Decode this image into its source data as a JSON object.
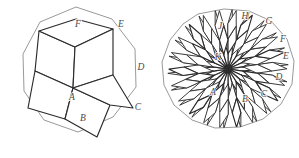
{
  "figure": {
    "caption": "",
    "colors": {
      "outline": "#8d8d8d",
      "rhombus_edge": "#2b2b2b",
      "label": "#4a4a4a",
      "background": "#ffffff"
    }
  },
  "left_figure": {
    "name": "decagon-rhombic-tiling",
    "polygon_sides": 10,
    "rhombus_count": 5,
    "center_vertex": "A-apex",
    "labels": [
      {
        "id": "A",
        "text": "A",
        "x": 73,
        "y": 98
      },
      {
        "id": "B",
        "text": "B",
        "x": 83,
        "y": 119
      },
      {
        "id": "C",
        "text": "C",
        "x": 139,
        "y": 108
      },
      {
        "id": "D",
        "text": "D",
        "x": 141,
        "y": 68
      },
      {
        "id": "E",
        "text": "E",
        "x": 121,
        "y": 27
      },
      {
        "id": "F",
        "text": "F",
        "x": 78,
        "y": 26
      }
    ],
    "polygon_points": "42,22 76,8 112,19 135,48 137,86 116,117 81,132 47,122 25,93 22,55",
    "rhombi": [
      "73,88 40,96 34,59 68,49",
      "68,49 73,88 107,92 104,52",
      "73,88 60,119 87,131 100,100",
      "37,99 73,88 60,119 33,109",
      "104,52 68,49 78,20 115,24"
    ],
    "rhombi_inner": [
      "68,49 104,52 107,92 73,88",
      "33,109 37,99 73,88 60,119",
      "60,119 73,88 100,100 87,131",
      "34,59 40,96 73,88 68,49",
      "78,20 115,24 104,52 68,49"
    ],
    "cube_rhombi": [
      "73,88 68,49 78,20 118,24 115,57 107,92",
      "73,88 40,96 34,59 68,49"
    ]
  },
  "right_figure": {
    "name": "polygon-full-rhombic-tiling",
    "polygon_sides": 22,
    "labels": [
      {
        "id": "A",
        "text": "A",
        "x": 212,
        "y": 92
      },
      {
        "id": "B",
        "text": "B",
        "x": 245,
        "y": 100
      },
      {
        "id": "C",
        "text": "C",
        "x": 264,
        "y": 96
      },
      {
        "id": "D",
        "text": "D",
        "x": 279,
        "y": 79
      },
      {
        "id": "E",
        "text": "E",
        "x": 286,
        "y": 58
      },
      {
        "id": "F",
        "text": "F",
        "x": 283,
        "y": 41
      },
      {
        "id": "G",
        "text": "G",
        "x": 270,
        "y": 23
      },
      {
        "id": "H",
        "text": "H",
        "x": 245,
        "y": 17
      },
      {
        "id": "J",
        "text": "J",
        "x": 220,
        "y": 27
      },
      {
        "id": "K",
        "text": "K",
        "x": 218,
        "y": 58
      }
    ],
    "polygon_points": "198,15 222,9 247,10 268,19 285,35 294,56 293,80 284,101 267,118 246,128 221,130 199,124 180,111 167,92 162,70 165,47 178,28"
  }
}
